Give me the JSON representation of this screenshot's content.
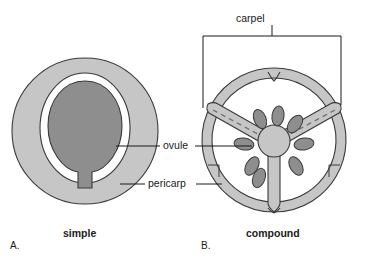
{
  "figure": {
    "type": "biological-diagram"
  },
  "labels": {
    "carpel": "carpel",
    "ovule": "ovule",
    "pericarp": "pericarp"
  },
  "captions": {
    "simple": "simple",
    "compound": "compound"
  },
  "panels": {
    "a": "A.",
    "b": "B."
  },
  "colors": {
    "pericarp_fill": "#c6c6c6",
    "ovule_fill": "#8e8e8e",
    "locule_fill": "#ffffff",
    "outline": "#3a3a3a",
    "leader_line": "#1a1a1a",
    "dashed_line": "#6e6e6e",
    "background": "#ffffff",
    "text": "#1a1a1a"
  },
  "panel_a": {
    "name": "simple-ovary",
    "description": "Single ovary with one central ovule surrounded by a locule and a pericarp wall",
    "outer_circle": {
      "cx": 85,
      "cy": 131,
      "rx": 73,
      "ry": 73
    },
    "locule": {
      "cx": 85,
      "cy": 128,
      "rx": 44,
      "ry": 54
    },
    "ovule": {
      "cx": 85,
      "cy": 127,
      "rx": 37,
      "ry": 46
    },
    "funiculus": {
      "x": 85,
      "y_top": 170,
      "y_bottom": 190,
      "width": 7
    }
  },
  "panel_b": {
    "name": "compound-ovary",
    "description": "Compound ovary of three fused carpels; three septa radiate from a central placenta bearing many ovules",
    "outer_ring": {
      "cx": 274,
      "cy": 140,
      "r_outer": 72,
      "r_inner": 62
    },
    "placenta": {
      "cx": 274,
      "cy": 140,
      "r": 16
    },
    "septa_angles_deg": [
      90,
      210,
      330
    ],
    "septa_count": 3,
    "locule_count": 3,
    "ovule_count": 8,
    "dashed_septa": [
      "upper-left",
      "upper-right"
    ]
  },
  "bracket": {
    "name": "carpel-bracket",
    "x_left": 203,
    "x_right": 341,
    "y_top": 36,
    "y_left_bottom": 108,
    "y_right_bottom": 105,
    "stem_x": 272,
    "stem_y_top": 25
  },
  "leaders": {
    "ovule_left": {
      "x1": 160,
      "x2": 116,
      "y": 146
    },
    "ovule_right": {
      "x1": 196,
      "x2": 252,
      "y": 146
    },
    "pericarp_left": {
      "x1": 145,
      "x2": 120,
      "y": 184
    },
    "pericarp_right": {
      "x1": 199,
      "x2": 222,
      "y": 184
    }
  }
}
